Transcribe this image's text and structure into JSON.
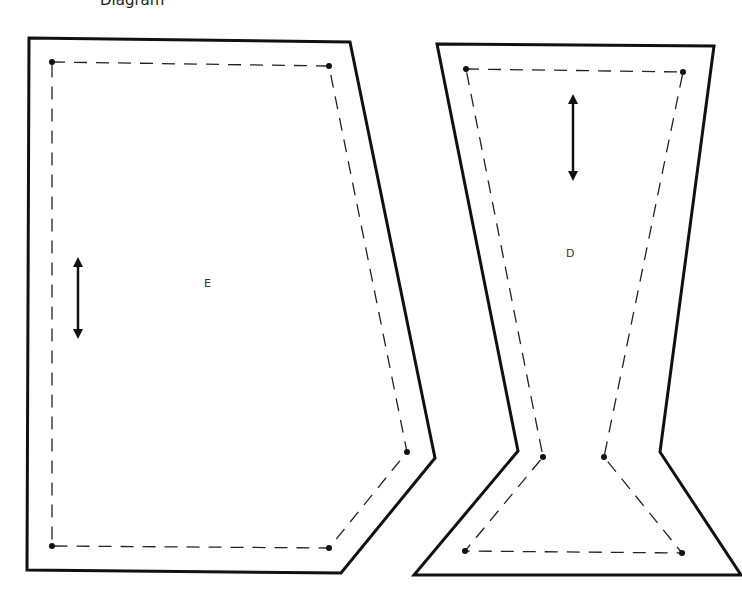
{
  "title": "Diagram",
  "pieces": [
    {
      "id": "E",
      "label": "E",
      "has_grainline_arrow": true,
      "seam_corner_count": 5
    },
    {
      "id": "D",
      "label": "D",
      "has_grainline_arrow": true,
      "seam_corner_count": 6
    }
  ],
  "colors": {
    "outline": "#111111",
    "seam": "#222222",
    "background": "#ffffff"
  }
}
